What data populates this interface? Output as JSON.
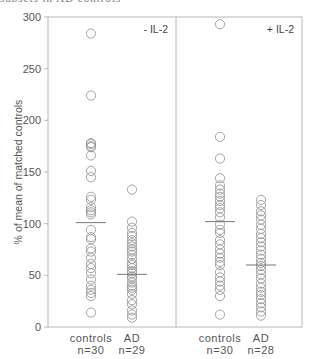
{
  "header": {
    "cut_off_title": "subsets in AD controls"
  },
  "chart_data": {
    "type": "scatter",
    "title": "",
    "ylabel": "% of mean of matched controls",
    "xlabel": "",
    "ylim": [
      0,
      300
    ],
    "yticks": [
      0,
      50,
      100,
      150,
      200,
      250,
      300
    ],
    "grid": false,
    "panels": [
      {
        "label": "- IL-2",
        "groups": [
          {
            "name": "controls",
            "n_label": "n=30",
            "mean": 101,
            "values": [
              284,
              224,
              178,
              177,
              175,
              174,
              166,
              151,
              145,
              126,
              123,
              116,
              113,
              111,
              109,
              94,
              87,
              85,
              76,
              73,
              67,
              61,
              57,
              52,
              46,
              40,
              36,
              33,
              30,
              14
            ]
          },
          {
            "name": "AD",
            "n_label": "n=29",
            "mean": 51,
            "values": [
              133,
              102,
              96,
              91,
              88,
              84,
              81,
              78,
              75,
              73,
              70,
              66,
              62,
              60,
              57,
              54,
              52,
              49,
              47,
              43,
              40,
              38,
              36,
              32,
              26,
              22,
              16,
              12,
              9
            ]
          }
        ]
      },
      {
        "label": "+ IL-2",
        "groups": [
          {
            "name": "controls",
            "n_label": "n=30",
            "mean": 102,
            "values": [
              293,
              184,
              163,
              144,
              137,
              133,
              129,
              126,
              122,
              118,
              115,
              111,
              106,
              99,
              94,
              91,
              84,
              80,
              75,
              71,
              67,
              63,
              60,
              53,
              48,
              44,
              40,
              36,
              30,
              12
            ]
          },
          {
            "name": "AD",
            "n_label": "n=28",
            "mean": 60,
            "values": [
              123,
              118,
              112,
              108,
              104,
              99,
              95,
              90,
              86,
              82,
              78,
              74,
              70,
              66,
              62,
              59,
              55,
              51,
              47,
              42,
              38,
              34,
              31,
              27,
              23,
              19,
              15,
              11
            ]
          }
        ]
      }
    ]
  },
  "colors": {
    "axis": "#b8b8b8",
    "marker": "#9a9a9a",
    "mean_line": "#777777",
    "text": "#555555"
  }
}
